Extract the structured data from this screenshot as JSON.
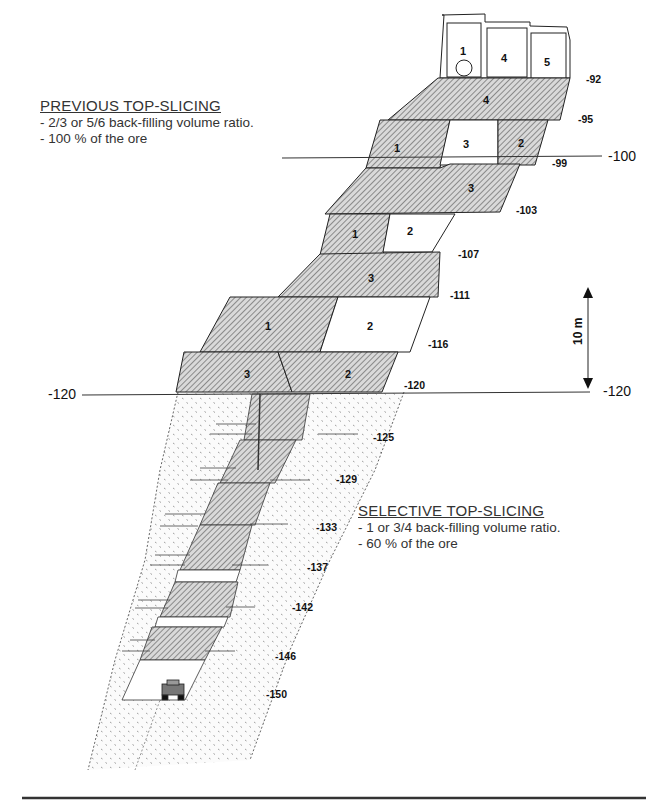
{
  "previous_method": {
    "title": "PREVIOUS TOP-SLICING",
    "lines": [
      "- 2/3 or 5/6 back-filling volume ratio.",
      "- 100 % of the ore"
    ]
  },
  "selective_method": {
    "title": "SELECTIVE TOP-SLICING",
    "lines": [
      "- 1 or 3/4 back-filling volume ratio.",
      "- 60 % of the ore"
    ]
  },
  "reference_levels": {
    "left_120": "-120",
    "right_120": "-120",
    "right_100": "-100"
  },
  "scale_bar": {
    "label": "10 m"
  },
  "top_cells": [
    "1",
    "4",
    "5"
  ],
  "elevations": [
    "-92",
    "-95",
    "-99",
    "-103",
    "-107",
    "-111",
    "-116",
    "-120",
    "-125",
    "-129",
    "-133",
    "-137",
    "-142",
    "-146",
    "-150"
  ],
  "slice_labels": {
    "s92": "4",
    "s95_a": "1",
    "s95_b": "3",
    "s95_c": "2",
    "s99": "3",
    "s103_a": "1",
    "s103_b": "2",
    "s107": "3",
    "s111_a": "1",
    "s111_b": "2",
    "s116_a": "3",
    "s116_b": "2"
  },
  "icons": {
    "loader": "mining-loader-icon",
    "ventilation": "circle-opening-icon"
  }
}
